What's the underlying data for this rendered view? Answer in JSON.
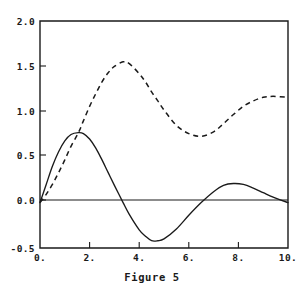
{
  "caption": "Figure 5",
  "chart_data": {
    "type": "line",
    "title": "Figure 5",
    "xlabel": "",
    "ylabel": "",
    "xlim": [
      0,
      10
    ],
    "ylim": [
      -0.5,
      2.0
    ],
    "grid": false,
    "legend": "none",
    "x_ticks": [
      0,
      2,
      4,
      6,
      8,
      10
    ],
    "x_tick_labels": [
      "0.",
      "2.",
      "4.",
      "6.",
      "8.",
      "10."
    ],
    "y_ticks": [
      -0.5,
      0.0,
      0.5,
      1.0,
      1.5,
      2.0
    ],
    "y_tick_labels": [
      "-0.5",
      "0.0",
      "0.5",
      "1.0",
      "1.5",
      "2.0"
    ],
    "zero_line": 0.0,
    "x": [
      0.0,
      0.25,
      0.5,
      0.75,
      1.0,
      1.25,
      1.55,
      1.75,
      2.0,
      2.25,
      2.5,
      2.75,
      3.0,
      3.35,
      3.6,
      4.0,
      4.25,
      4.5,
      4.75,
      5.0,
      5.5,
      6.0,
      6.5,
      7.0,
      7.4,
      7.8,
      8.2,
      8.6,
      9.0,
      9.4,
      10.0
    ],
    "series": [
      {
        "name": "solid-curve",
        "style": "solid",
        "values": [
          0.0,
          0.2,
          0.4,
          0.56,
          0.68,
          0.75,
          0.77,
          0.76,
          0.7,
          0.6,
          0.47,
          0.33,
          0.19,
          0.0,
          -0.13,
          -0.3,
          -0.37,
          -0.42,
          -0.42,
          -0.4,
          -0.29,
          -0.14,
          0.0,
          0.12,
          0.19,
          0.21,
          0.2,
          0.16,
          0.11,
          0.06,
          0.0
        ]
      },
      {
        "name": "dashed-curve",
        "style": "dashed",
        "values": [
          0.0,
          0.09,
          0.2,
          0.33,
          0.47,
          0.62,
          0.77,
          0.9,
          1.06,
          1.2,
          1.33,
          1.43,
          1.5,
          1.55,
          1.53,
          1.42,
          1.33,
          1.22,
          1.12,
          1.02,
          0.85,
          0.76,
          0.73,
          0.78,
          0.87,
          0.97,
          1.06,
          1.12,
          1.16,
          1.17,
          1.16
        ]
      }
    ]
  },
  "axis": {
    "y_top": "2.0",
    "y_1_5": "1.5",
    "y_1_0": "1.0",
    "y_0_5": "0.5",
    "y_0_0": "0.0",
    "y_bottom": "-0.5",
    "x_0": "0.",
    "x_2": "2.",
    "x_4": "4.",
    "x_6": "6.",
    "x_8": "8.",
    "x_10": "10."
  },
  "colors": {
    "ink": "#1a1a1a",
    "background": "#ffffff"
  }
}
